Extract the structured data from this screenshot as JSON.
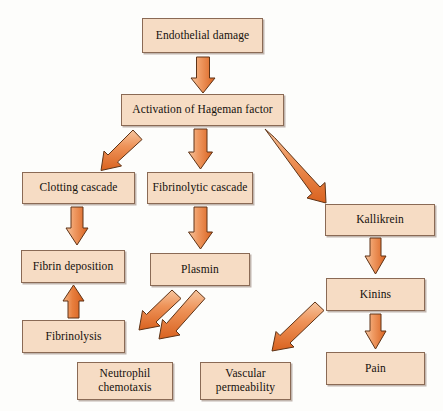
{
  "diagram": {
    "canvas": {
      "width": 443,
      "height": 411
    },
    "palette": {
      "background": "#fdfdfb",
      "box_fill": "#f6dcc4",
      "box_border": "#8a6a55",
      "arrow_light": "#f2ae80",
      "arrow_dark": "#dd6a2a",
      "arrow_outline": "#6b3a1c",
      "text": "#14100c"
    },
    "nodes": [
      {
        "id": "endothelial-damage",
        "label": "Endothelial damage",
        "x": 142,
        "y": 18,
        "w": 121,
        "h": 35
      },
      {
        "id": "hageman-activation",
        "label": "Activation of Hageman factor",
        "x": 121,
        "y": 94,
        "w": 163,
        "h": 32
      },
      {
        "id": "clotting-cascade",
        "label": "Clotting cascade",
        "x": 22,
        "y": 172,
        "w": 113,
        "h": 32
      },
      {
        "id": "fibrinolytic-cascade",
        "label": "Fibrinolytic cascade",
        "x": 147,
        "y": 172,
        "w": 106,
        "h": 32
      },
      {
        "id": "kallikrein",
        "label": "Kallikrein",
        "x": 325,
        "y": 204,
        "w": 110,
        "h": 32
      },
      {
        "id": "fibrin-deposition",
        "label": "Fibrin deposition",
        "x": 21,
        "y": 250,
        "w": 104,
        "h": 33
      },
      {
        "id": "plasmin",
        "label": "Plasmin",
        "x": 150,
        "y": 253,
        "w": 100,
        "h": 33
      },
      {
        "id": "kinins",
        "label": "Kinins",
        "x": 326,
        "y": 278,
        "w": 99,
        "h": 33
      },
      {
        "id": "fibrinolysis",
        "label": "Fibrinolysis",
        "x": 22,
        "y": 320,
        "w": 103,
        "h": 33
      },
      {
        "id": "neutrophil-chemotaxis",
        "label": "Neutrophil\nchemotaxis",
        "x": 77,
        "y": 362,
        "w": 96,
        "h": 38
      },
      {
        "id": "vascular-permeability",
        "label": "Vascular\npermeability",
        "x": 200,
        "y": 362,
        "w": 91,
        "h": 38
      },
      {
        "id": "pain",
        "label": "Pain",
        "x": 326,
        "y": 352,
        "w": 99,
        "h": 33
      }
    ],
    "arrows": [
      {
        "id": "arrow-endothelial-to-hageman",
        "from": "endothelial-damage",
        "to": "hageman-activation",
        "kind": "vertical-down"
      },
      {
        "id": "arrow-hageman-to-clotting",
        "from": "hageman-activation",
        "to": "clotting-cascade",
        "kind": "diagonal-down-left"
      },
      {
        "id": "arrow-hageman-to-fibrinolytic",
        "from": "hageman-activation",
        "to": "fibrinolytic-cascade",
        "kind": "vertical-down"
      },
      {
        "id": "arrow-hageman-to-kallikrein",
        "from": "hageman-activation",
        "to": "kallikrein",
        "kind": "diagonal-down-right"
      },
      {
        "id": "arrow-clotting-to-fibrin",
        "from": "clotting-cascade",
        "to": "fibrin-deposition",
        "kind": "vertical-down"
      },
      {
        "id": "arrow-fibrinolytic-to-plasmin",
        "from": "fibrinolytic-cascade",
        "to": "plasmin",
        "kind": "vertical-down"
      },
      {
        "id": "arrow-kallikrein-to-kinins",
        "from": "kallikrein",
        "to": "kinins",
        "kind": "vertical-down"
      },
      {
        "id": "arrow-fibrinolysis-to-fibrin",
        "from": "fibrinolysis",
        "to": "fibrin-deposition",
        "kind": "vertical-up"
      },
      {
        "id": "arrow-plasmin-to-fibrinolysis",
        "from": "plasmin",
        "to": "fibrinolysis",
        "kind": "diagonal-down-left"
      },
      {
        "id": "arrow-plasmin-to-neutrophil",
        "from": "plasmin",
        "to": "neutrophil-chemotaxis",
        "kind": "diagonal-down-left"
      },
      {
        "id": "arrow-kinins-to-vascular",
        "from": "kinins",
        "to": "vascular-permeability",
        "kind": "diagonal-down-left"
      },
      {
        "id": "arrow-kinins-to-pain",
        "from": "kinins",
        "to": "pain",
        "kind": "vertical-down"
      }
    ]
  }
}
